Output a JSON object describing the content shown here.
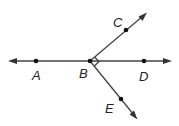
{
  "diagram": {
    "type": "geometry-rays",
    "colors": {
      "line": "#444444",
      "point": "#111111",
      "label": "#222222",
      "background": "#ffffff"
    },
    "points": [
      {
        "id": "A",
        "label": "A",
        "x": 36,
        "y": 61
      },
      {
        "id": "B",
        "label": "B",
        "x": 90,
        "y": 61
      },
      {
        "id": "C",
        "label": "C",
        "x": 126,
        "y": 30
      },
      {
        "id": "D",
        "label": "D",
        "x": 144,
        "y": 61
      },
      {
        "id": "E",
        "label": "E",
        "x": 121,
        "y": 99
      }
    ],
    "lines": [
      {
        "name": "line AD",
        "through": [
          "A",
          "B",
          "D"
        ],
        "arrows": "both"
      },
      {
        "name": "ray BC",
        "from": "B",
        "through": "C",
        "arrows": "end"
      },
      {
        "name": "ray BE",
        "from": "B",
        "through": "E",
        "arrows": "end"
      }
    ],
    "right_angle": {
      "vertex": "B",
      "between": [
        "C",
        "E"
      ]
    },
    "labels": {
      "A": "A",
      "B": "B",
      "C": "C",
      "D": "D",
      "E": "E"
    }
  }
}
